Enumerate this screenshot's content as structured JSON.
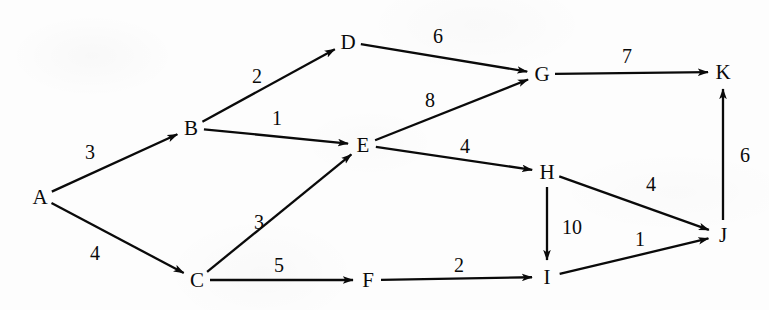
{
  "diagram": {
    "type": "weighted-directed-graph",
    "background_color": "#fdfdfd",
    "ink_color": "#0a0a0a",
    "node_count": 11,
    "edge_count": 13,
    "nodes": [
      {
        "id": "A",
        "label": "A",
        "x": 40,
        "y": 197
      },
      {
        "id": "B",
        "label": "B",
        "x": 191,
        "y": 128
      },
      {
        "id": "C",
        "label": "C",
        "x": 197,
        "y": 280
      },
      {
        "id": "D",
        "label": "D",
        "x": 348,
        "y": 42
      },
      {
        "id": "E",
        "label": "E",
        "x": 363,
        "y": 145
      },
      {
        "id": "F",
        "label": "F",
        "x": 368,
        "y": 280
      },
      {
        "id": "G",
        "label": "G",
        "x": 542,
        "y": 74
      },
      {
        "id": "H",
        "label": "H",
        "x": 547,
        "y": 172
      },
      {
        "id": "I",
        "label": "I",
        "x": 547,
        "y": 277
      },
      {
        "id": "J",
        "label": "J",
        "x": 723,
        "y": 235
      },
      {
        "id": "K",
        "label": "K",
        "x": 723,
        "y": 72
      }
    ],
    "edges": [
      {
        "id": "A-B",
        "from": "A",
        "to": "B",
        "weight": "3",
        "label_x": 90,
        "label_y": 152
      },
      {
        "id": "A-C",
        "from": "A",
        "to": "C",
        "weight": "4",
        "label_x": 95,
        "label_y": 253
      },
      {
        "id": "B-D",
        "from": "B",
        "to": "D",
        "weight": "2",
        "label_x": 257,
        "label_y": 76
      },
      {
        "id": "B-E",
        "from": "B",
        "to": "E",
        "weight": "1",
        "label_x": 277,
        "label_y": 118
      },
      {
        "id": "C-E",
        "from": "C",
        "to": "E",
        "weight": "3",
        "label_x": 259,
        "label_y": 222
      },
      {
        "id": "C-F",
        "from": "C",
        "to": "F",
        "weight": "5",
        "label_x": 279,
        "label_y": 265
      },
      {
        "id": "D-G",
        "from": "D",
        "to": "G",
        "weight": "6",
        "label_x": 438,
        "label_y": 36
      },
      {
        "id": "E-G",
        "from": "E",
        "to": "G",
        "weight": "8",
        "label_x": 430,
        "label_y": 100
      },
      {
        "id": "E-H",
        "from": "E",
        "to": "H",
        "weight": "4",
        "label_x": 465,
        "label_y": 146
      },
      {
        "id": "F-I",
        "from": "F",
        "to": "I",
        "weight": "2",
        "label_x": 459,
        "label_y": 265
      },
      {
        "id": "G-K",
        "from": "G",
        "to": "K",
        "weight": "7",
        "label_x": 627,
        "label_y": 56
      },
      {
        "id": "H-I",
        "from": "H",
        "to": "I",
        "weight": "10",
        "label_x": 572,
        "label_y": 227
      },
      {
        "id": "H-J",
        "from": "H",
        "to": "J",
        "weight": "4",
        "label_x": 651,
        "label_y": 184
      },
      {
        "id": "I-J",
        "from": "I",
        "to": "J",
        "weight": "1",
        "label_x": 640,
        "label_y": 239
      },
      {
        "id": "J-K",
        "from": "J",
        "to": "K",
        "weight": "6",
        "label_x": 745,
        "label_y": 155
      }
    ]
  }
}
